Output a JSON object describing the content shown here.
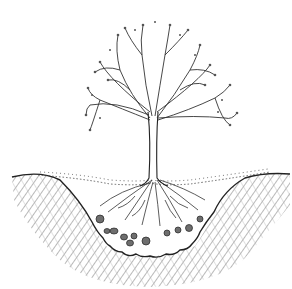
{
  "image": {
    "subject": "Tree planted in a dug pit, cross-section illustration",
    "style": "black ink line drawing on white",
    "colors": {
      "background": "#ffffff",
      "ink": "#2a2a2a",
      "soil_hatch": "#9a9a9a",
      "stones": "#6e6e6e"
    }
  },
  "elements": {
    "canopy": "bare deciduous tree crown with buds",
    "trunk": "single trunk",
    "roots": "spreading root system in backfill",
    "pit": "wide shallow planting pit with stones at bottom",
    "native_soil": "hatched surrounding soil",
    "mulch": "stippled surface layer"
  }
}
